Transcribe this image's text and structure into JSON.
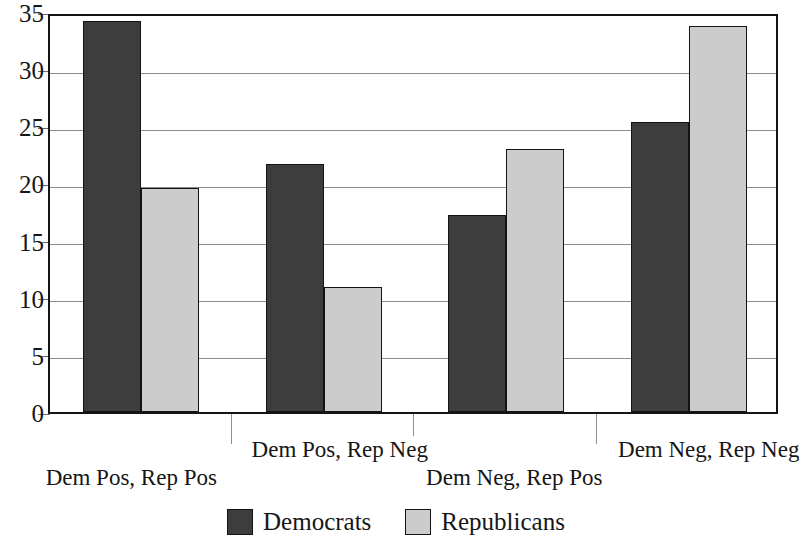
{
  "chart_data": {
    "type": "bar",
    "title": "",
    "subtitle": "",
    "xlabel": "",
    "ylabel": "",
    "ylim": [
      0,
      35
    ],
    "ytick_step": 5,
    "yticks": [
      "0",
      "5",
      "10",
      "15",
      "20",
      "25",
      "30",
      "35"
    ],
    "grid": "horizontal",
    "legend_position": "bottom-center",
    "categories": [
      "Dem Pos, Rep Pos",
      "Dem Pos, Rep Neg",
      "Dem Neg, Rep Pos",
      "Dem Neg, Rep Neg"
    ],
    "series": [
      {
        "name": "Democrats",
        "color": "#3d3d3d",
        "values": [
          34.2,
          21.7,
          17.2,
          25.4
        ]
      },
      {
        "name": "Republicans",
        "color": "#cccccc",
        "values": [
          19.6,
          10.9,
          23.0,
          33.8
        ]
      }
    ]
  },
  "legend": {
    "entries": [
      {
        "label": "Democrats",
        "color": "#3d3d3d"
      },
      {
        "label": "Republicans",
        "color": "#cccccc"
      }
    ]
  },
  "colors": {
    "democrats": "#3d3d3d",
    "republicans": "#cccccc",
    "axis": "#141414",
    "gridline": "#8c8c8c",
    "background": "#ffffff"
  }
}
